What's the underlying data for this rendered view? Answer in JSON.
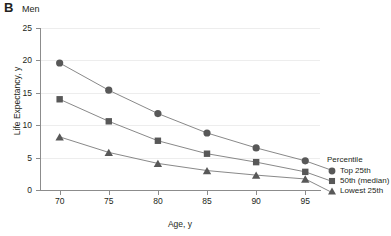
{
  "panel": {
    "letter": "B",
    "title": "Men"
  },
  "chart_data": {
    "type": "line",
    "title": "Men",
    "panel_label": "B",
    "xlabel": "Age, y",
    "ylabel": "Life Expectancy, y",
    "x": [
      70,
      75,
      80,
      85,
      90,
      95
    ],
    "xtick_labels": [
      "70",
      "75",
      "80",
      "85",
      "90",
      "95"
    ],
    "ytick_labels": [
      "0",
      "5",
      "10",
      "15",
      "20",
      "25"
    ],
    "yticks": [
      0,
      5,
      10,
      15,
      20,
      25
    ],
    "xlim": [
      68,
      96.5
    ],
    "ylim": [
      0,
      25
    ],
    "grid": "horizontal",
    "legend_title": "Percentile",
    "legend_position": "right-outside",
    "marker_color": "#585858",
    "line_color": "#7a7a7a",
    "grid_color": "#ededed",
    "axis_color": "#8c8c8c",
    "series": [
      {
        "name": "Top 25th",
        "marker": "circle",
        "values": [
          19.6,
          15.4,
          11.8,
          8.8,
          6.5,
          4.5
        ]
      },
      {
        "name": "50th (median)",
        "marker": "square",
        "values": [
          14.0,
          10.6,
          7.6,
          5.6,
          4.3,
          2.8
        ]
      },
      {
        "name": "Lowest 25th",
        "marker": "triangle",
        "values": [
          8.2,
          5.8,
          4.1,
          3.0,
          2.3,
          1.7
        ]
      }
    ]
  },
  "legend": {
    "title": "Percentile",
    "items": [
      {
        "label": "Top 25th",
        "marker": "circle"
      },
      {
        "label": "50th (median)",
        "marker": "square"
      },
      {
        "label": "Lowest 25th",
        "marker": "triangle"
      }
    ]
  }
}
